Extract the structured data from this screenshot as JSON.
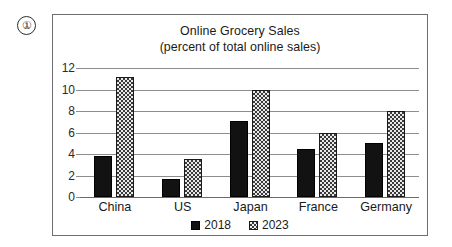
{
  "item_marker": {
    "label": "①"
  },
  "chart_data": {
    "type": "bar",
    "title": "Online Grocery Sales",
    "subtitle": "(percent of total online sales)",
    "xlabel": "",
    "ylabel": "",
    "ylim": [
      0,
      12
    ],
    "yticks": [
      0,
      2,
      4,
      6,
      8,
      10,
      12
    ],
    "ytick_labels": [
      "0",
      "2",
      "4",
      "6",
      "8",
      "10",
      "12"
    ],
    "grid": true,
    "legend_position": "bottom-center",
    "categories": [
      "China",
      "US",
      "Japan",
      "France",
      "Germany"
    ],
    "series": [
      {
        "name": "2018",
        "values": [
          3.8,
          1.7,
          7.1,
          4.5,
          5.0
        ],
        "style": "solid-black"
      },
      {
        "name": "2023",
        "values": [
          11.2,
          3.5,
          10.0,
          6.0,
          8.0
        ],
        "style": "checkered"
      }
    ]
  },
  "legend": {
    "items": [
      {
        "label": "2018",
        "swatch": "solid-black-square-icon"
      },
      {
        "label": "2023",
        "swatch": "checkered-square-icon"
      }
    ]
  }
}
